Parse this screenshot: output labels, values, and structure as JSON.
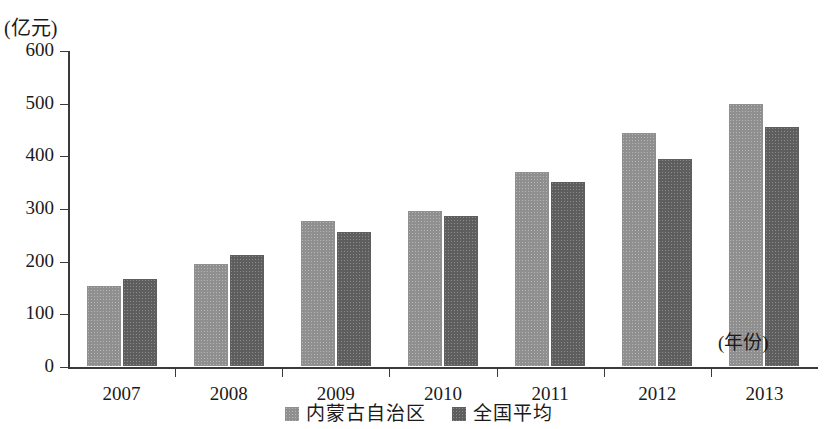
{
  "chart_data": {
    "type": "bar",
    "title": "",
    "subtitle": "",
    "xlabel": "(年份)",
    "ylabel": "(亿元)",
    "categories": [
      "2007",
      "2008",
      "2009",
      "2010",
      "2011",
      "2012",
      "2013"
    ],
    "series": [
      {
        "name": "内蒙古自治区",
        "color": "#8f8f8f",
        "values": [
          152,
          194,
          275,
          295,
          368,
          442,
          498
        ]
      },
      {
        "name": "全国平均",
        "color": "#5e5e5e",
        "values": [
          165,
          210,
          255,
          284,
          349,
          394,
          453
        ]
      }
    ],
    "ylim": [
      0,
      600
    ],
    "y_ticks": [
      "0",
      "100",
      "200",
      "300",
      "400",
      "500",
      "600"
    ],
    "y_tick_values": [
      0,
      100,
      200,
      300,
      400,
      500,
      600
    ],
    "grid": false,
    "legend_position": "bottom-center"
  },
  "legend": {
    "items": [
      {
        "label": "内蒙古自治区",
        "swatch": "light-gray-swatch"
      },
      {
        "label": "全国平均",
        "swatch": "dark-gray-swatch"
      }
    ]
  }
}
